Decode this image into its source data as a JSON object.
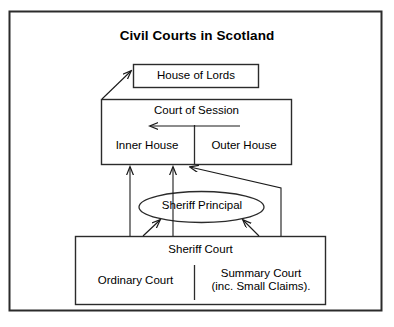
{
  "diagram": {
    "title": "Civil Courts in Scotland",
    "nodes": {
      "house_of_lords": {
        "label": "House of Lords",
        "shape": "rectangle"
      },
      "court_of_session": {
        "label": "Court of Session",
        "shape": "rectangle"
      },
      "inner_house": {
        "label": "Inner House",
        "shape": "rectangle-section"
      },
      "outer_house": {
        "label": "Outer House",
        "shape": "rectangle-section"
      },
      "sheriff_principal": {
        "label": "Sheriff Principal",
        "shape": "ellipse"
      },
      "sheriff_court": {
        "label": "Sheriff Court",
        "shape": "rectangle"
      },
      "ordinary_court": {
        "label": "Ordinary Court",
        "shape": "rectangle-section"
      },
      "summary_court": {
        "label_line1": "Summary Court",
        "label_line2": "(inc. Small Claims).",
        "shape": "rectangle-section"
      }
    },
    "edges": [
      {
        "from": "court_of_session",
        "to": "house_of_lords",
        "style": "diagonal-arrow"
      },
      {
        "from": "outer_house",
        "to": "inner_house",
        "style": "horizontal-arrow-left"
      },
      {
        "from": "sheriff_court",
        "to": "inner_house",
        "style": "vertical-arrow-up"
      },
      {
        "from": "sheriff_court",
        "to": "court_of_session",
        "style": "vertical-arrow-up"
      },
      {
        "from": "sheriff_court",
        "to": "inner_house",
        "style": "elbow-arrow"
      },
      {
        "from": "ordinary_court",
        "to": "sheriff_principal",
        "style": "diagonal-arrow"
      },
      {
        "from": "summary_court",
        "to": "sheriff_principal",
        "style": "diagonal-arrow"
      }
    ],
    "colors": {
      "line": "#1a1a1a",
      "text": "#000000",
      "background": "#ffffff"
    }
  }
}
